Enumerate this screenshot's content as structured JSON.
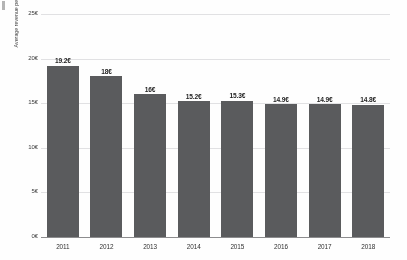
{
  "chart_data": {
    "type": "bar",
    "title": "",
    "subtitle": "",
    "xlabel": "",
    "ylabel": "Average revenue per user in euros per month",
    "categories": [
      "2011",
      "2012",
      "2013",
      "2014",
      "2015",
      "2016",
      "2017",
      "2018"
    ],
    "values": [
      19.2,
      18,
      16,
      15.2,
      15.3,
      14.9,
      14.9,
      14.8
    ],
    "value_labels": [
      "19.2€",
      "18€",
      "16€",
      "15.2€",
      "15.3€",
      "14.9€",
      "14.9€",
      "14.8€"
    ],
    "ylim": [
      0,
      25
    ],
    "y_ticks": [
      0,
      5,
      10,
      15,
      20,
      25
    ],
    "y_tick_labels": [
      "0€",
      "5€",
      "10€",
      "15€",
      "20€",
      "25€"
    ],
    "grid": true,
    "legend": "none",
    "legend_position": "none",
    "bar_color": "#58595b",
    "gridline_color": "#e2e2e4",
    "axis_color": "#8b8b8d",
    "background_color": "#ffffff",
    "label_color": "#1c1c1c"
  }
}
